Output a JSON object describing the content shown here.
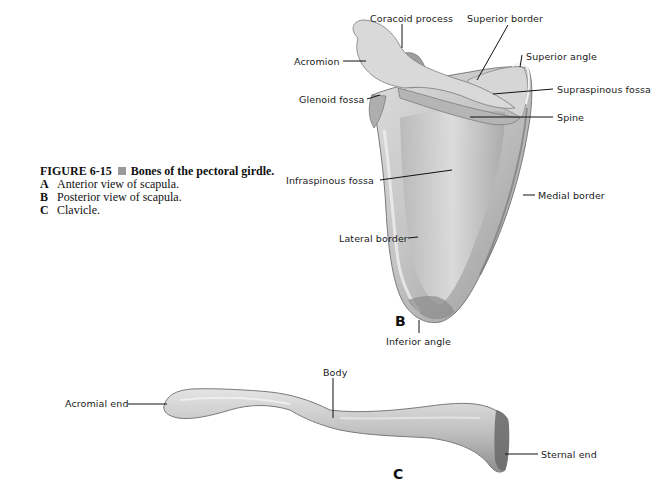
{
  "caption": {
    "figure_number": "FIGURE 6-15",
    "title": "Bones of the pectoral girdle.",
    "items": [
      {
        "key": "A",
        "text": "Anterior view of scapula."
      },
      {
        "key": "B",
        "text": "Posterior view of scapula."
      },
      {
        "key": "C",
        "text": "Clavicle."
      }
    ]
  },
  "scapula_panel": {
    "panel_letter": "B",
    "labels": {
      "coracoid_process": "Coracoid process",
      "superior_border": "Superior border",
      "acromion": "Acromion",
      "superior_angle": "Superior angle",
      "glenoid_fossa": "Glenoid fossa",
      "supraspinous_fossa": "Supraspinous fossa",
      "spine": "Spine",
      "infraspinous_fossa": "Infraspinous fossa",
      "medial_border": "Medial border",
      "lateral_border": "Lateral border",
      "inferior_angle": "Inferior angle"
    }
  },
  "clavicle_panel": {
    "panel_letter": "C",
    "labels": {
      "body": "Body",
      "acromial_end": "Acromial end",
      "sternal_end": "Sternal end"
    }
  },
  "colors": {
    "bone_light": "#e8e8e8",
    "bone_mid": "#bdbdbd",
    "bone_dark": "#6e6e6e",
    "leader_line": "#111111",
    "caption_square": "#9a9a9a"
  }
}
